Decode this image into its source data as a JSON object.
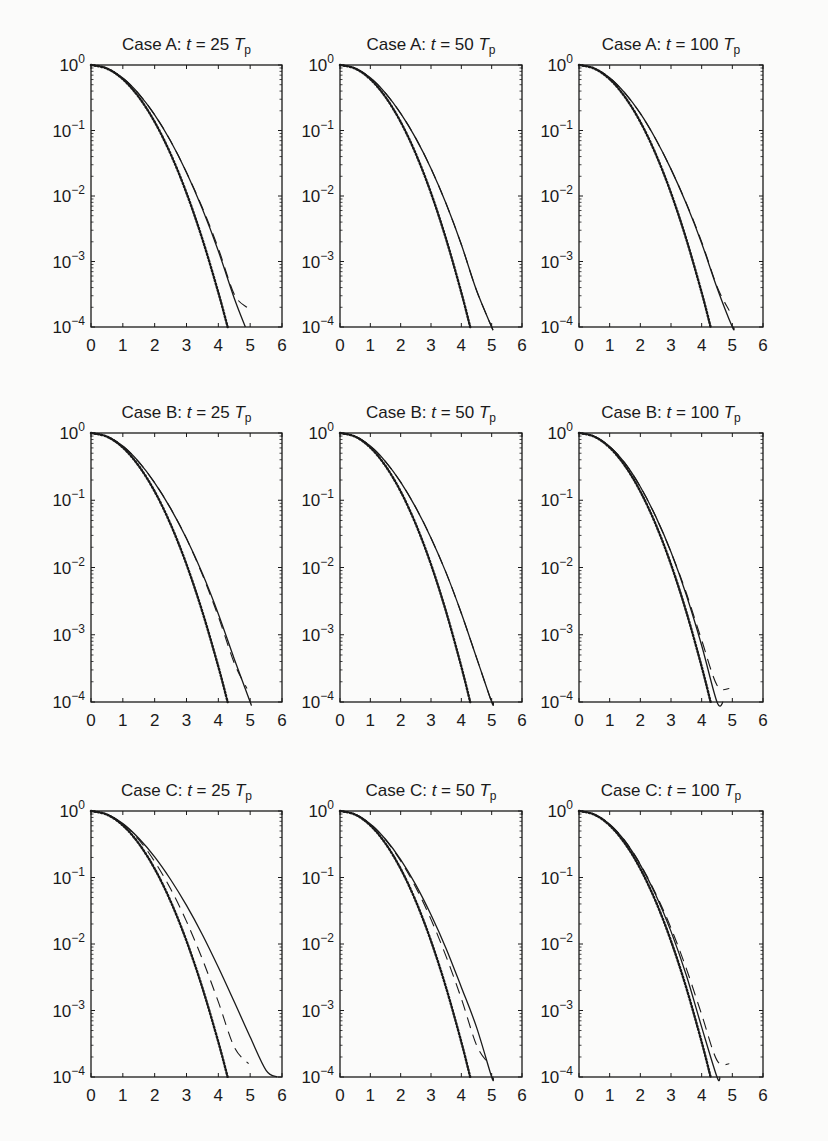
{
  "chart_data": {
    "type": "line",
    "layout": {
      "rows": 3,
      "cols": 3,
      "grid": false,
      "legend": "none"
    },
    "x_ticks": [
      "0",
      "1",
      "2",
      "3",
      "4",
      "5",
      "6"
    ],
    "xlim": [
      0,
      6
    ],
    "y_ticks": [
      "10^0",
      "10^-1",
      "10^-2",
      "10^-3",
      "10^-4"
    ],
    "ylim": [
      0.0001,
      1
    ],
    "yscale": "log",
    "series_styles": {
      "reference": "dotted with markers (Rayleigh)",
      "solid": "solid line",
      "dashed": "dashed line"
    },
    "x": [
      0,
      0.5,
      1,
      1.5,
      2,
      2.5,
      3,
      3.5,
      4,
      4.5,
      5,
      5.5,
      6
    ],
    "panels": [
      {
        "id": "A25",
        "case": "A",
        "t": "25",
        "title": "Case A: t = 25 T_p",
        "series": [
          {
            "name": "reference",
            "log10": [
              0,
              -0.054,
              -0.217,
              -0.489,
              -0.869,
              -1.357,
              -1.954,
              -2.66,
              -3.474,
              -4.0,
              null,
              null,
              null
            ]
          },
          {
            "name": "solid",
            "log10": [
              0,
              -0.05,
              -0.2,
              -0.44,
              -0.76,
              -1.16,
              -1.64,
              -2.2,
              -2.84,
              -3.56,
              null,
              null,
              null
            ],
            "end_x": 4.85
          },
          {
            "name": "dashed",
            "log10": [
              0,
              -0.05,
              -0.2,
              -0.44,
              -0.76,
              -1.16,
              -1.64,
              -2.18,
              -2.8,
              -3.5,
              null,
              null,
              null
            ],
            "end": [
              4.9,
              -3.7
            ]
          }
        ]
      },
      {
        "id": "A50",
        "case": "A",
        "t": "50",
        "title": "Case A: t = 50 T_p",
        "series": [
          {
            "name": "reference",
            "log10": [
              0,
              -0.054,
              -0.217,
              -0.489,
              -0.869,
              -1.357,
              -1.954,
              -2.66,
              -3.474,
              -4.0,
              null,
              null,
              null
            ]
          },
          {
            "name": "solid",
            "log10": [
              0,
              -0.05,
              -0.195,
              -0.43,
              -0.74,
              -1.12,
              -1.58,
              -2.12,
              -2.74,
              -3.44,
              -4.0,
              null,
              null
            ],
            "end_x": 5.0
          },
          {
            "name": "dashed",
            "log10": [
              0,
              -0.05,
              -0.195,
              -0.43,
              -0.74,
              -1.12,
              -1.58,
              -2.12,
              -2.74,
              -3.44,
              -4.0,
              null,
              null
            ],
            "end_x": 5.0
          }
        ]
      },
      {
        "id": "A100",
        "case": "A",
        "t": "100",
        "title": "Case A: t = 100 T_p",
        "series": [
          {
            "name": "reference",
            "log10": [
              0,
              -0.054,
              -0.217,
              -0.489,
              -0.869,
              -1.357,
              -1.954,
              -2.66,
              -3.474,
              -4.0,
              null,
              null,
              null
            ]
          },
          {
            "name": "solid",
            "log10": [
              0,
              -0.05,
              -0.195,
              -0.43,
              -0.74,
              -1.13,
              -1.59,
              -2.12,
              -2.72,
              -3.4,
              -4.0,
              null,
              null
            ],
            "end_x": 5.05
          },
          {
            "name": "dashed",
            "log10": [
              0,
              -0.05,
              -0.195,
              -0.43,
              -0.74,
              -1.13,
              -1.59,
              -2.11,
              -2.7,
              -3.38,
              null,
              null,
              null
            ],
            "end": [
              4.9,
              -3.75
            ]
          }
        ]
      },
      {
        "id": "B25",
        "case": "B",
        "t": "25",
        "title": "Case B: t = 25 T_p",
        "series": [
          {
            "name": "reference",
            "log10": [
              0,
              -0.054,
              -0.217,
              -0.489,
              -0.869,
              -1.357,
              -1.954,
              -2.66,
              -3.474,
              -4.0,
              null,
              null,
              null
            ]
          },
          {
            "name": "solid",
            "log10": [
              0,
              -0.05,
              -0.195,
              -0.43,
              -0.74,
              -1.12,
              -1.57,
              -2.09,
              -2.69,
              -3.36,
              -4.0,
              null,
              null
            ],
            "end_x": 5.0
          },
          {
            "name": "dashed",
            "log10": [
              0,
              -0.05,
              -0.195,
              -0.43,
              -0.74,
              -1.12,
              -1.57,
              -2.11,
              -2.73,
              -3.42,
              null,
              null,
              null
            ],
            "end": [
              4.9,
              -3.8
            ]
          }
        ]
      },
      {
        "id": "B50",
        "case": "B",
        "t": "50",
        "title": "Case B: t = 50 T_p",
        "series": [
          {
            "name": "reference",
            "log10": [
              0,
              -0.054,
              -0.217,
              -0.489,
              -0.869,
              -1.357,
              -1.954,
              -2.66,
              -3.474,
              -4.0,
              null,
              null,
              null
            ]
          },
          {
            "name": "solid",
            "log10": [
              0,
              -0.05,
              -0.195,
              -0.425,
              -0.73,
              -1.11,
              -1.56,
              -2.08,
              -2.68,
              -3.34,
              -4.0,
              null,
              null
            ],
            "end_x": 5.05
          },
          {
            "name": "dashed",
            "log10": [
              0,
              -0.05,
              -0.195,
              -0.425,
              -0.73,
              -1.11,
              -1.56,
              -2.08,
              -2.68,
              -3.34,
              -4.0,
              null,
              null
            ],
            "end_x": 5.05
          }
        ]
      },
      {
        "id": "B100",
        "case": "B",
        "t": "100",
        "title": "Case B: t = 100 T_p",
        "series": [
          {
            "name": "reference",
            "log10": [
              0,
              -0.054,
              -0.217,
              -0.489,
              -0.869,
              -1.357,
              -1.954,
              -2.66,
              -3.474,
              -4.0,
              null,
              null,
              null
            ]
          },
          {
            "name": "solid",
            "log10": [
              0,
              -0.05,
              -0.2,
              -0.45,
              -0.8,
              -1.24,
              -1.77,
              -2.41,
              -3.16,
              -4.0,
              null,
              null,
              null
            ],
            "end_x": 4.7
          },
          {
            "name": "dashed",
            "log10": [
              0,
              -0.05,
              -0.2,
              -0.45,
              -0.8,
              -1.24,
              -1.77,
              -2.38,
              -3.08,
              -3.75,
              null,
              null,
              null
            ],
            "end": [
              4.9,
              -3.8
            ]
          }
        ]
      },
      {
        "id": "C25",
        "case": "C",
        "t": "25",
        "title": "Case C: t = 25 T_p",
        "series": [
          {
            "name": "reference",
            "log10": [
              0,
              -0.054,
              -0.217,
              -0.489,
              -0.869,
              -1.357,
              -1.954,
              -2.66,
              -3.474,
              -4.0,
              null,
              null,
              null
            ]
          },
          {
            "name": "solid",
            "log10": [
              0,
              -0.05,
              -0.19,
              -0.41,
              -0.69,
              -1.03,
              -1.42,
              -1.86,
              -2.35,
              -2.87,
              -3.4,
              -3.9,
              null
            ],
            "end_x": 5.85
          },
          {
            "name": "dashed",
            "log10": [
              0,
              -0.05,
              -0.195,
              -0.43,
              -0.76,
              -1.17,
              -1.66,
              -2.23,
              -2.87,
              -3.55,
              null,
              null,
              null
            ],
            "end": [
              4.95,
              -3.8
            ]
          }
        ]
      },
      {
        "id": "C50",
        "case": "C",
        "t": "50",
        "title": "Case C: t = 50 T_p",
        "series": [
          {
            "name": "reference",
            "log10": [
              0,
              -0.054,
              -0.217,
              -0.489,
              -0.869,
              -1.357,
              -1.954,
              -2.66,
              -3.474,
              -4.0,
              null,
              null,
              null
            ]
          },
          {
            "name": "solid",
            "log10": [
              0,
              -0.05,
              -0.195,
              -0.425,
              -0.73,
              -1.11,
              -1.56,
              -2.07,
              -2.65,
              -3.25,
              -4.0,
              null,
              null
            ],
            "end_x": 5.05
          },
          {
            "name": "dashed",
            "log10": [
              0,
              -0.05,
              -0.195,
              -0.43,
              -0.75,
              -1.15,
              -1.63,
              -2.19,
              -2.82,
              -3.52,
              null,
              null,
              null
            ],
            "end": [
              4.9,
              -3.8
            ]
          }
        ]
      },
      {
        "id": "C100",
        "case": "C",
        "t": "100",
        "title": "Case C: t = 100 T_p",
        "series": [
          {
            "name": "reference",
            "log10": [
              0,
              -0.054,
              -0.217,
              -0.489,
              -0.869,
              -1.357,
              -1.954,
              -2.66,
              -3.474,
              -4.0,
              null,
              null,
              null
            ]
          },
          {
            "name": "solid",
            "log10": [
              0,
              -0.05,
              -0.2,
              -0.455,
              -0.81,
              -1.26,
              -1.81,
              -2.47,
              -3.25,
              -4.0,
              null,
              null,
              null
            ],
            "end_x": 4.6
          },
          {
            "name": "dashed",
            "log10": [
              0,
              -0.05,
              -0.2,
              -0.45,
              -0.8,
              -1.24,
              -1.76,
              -2.37,
              -3.06,
              -3.75,
              null,
              null,
              null
            ],
            "end": [
              4.9,
              -3.8
            ]
          }
        ]
      }
    ]
  },
  "labels": {
    "panel_titles": [
      {
        "prefix": "Case A: ",
        "var": "t",
        "eq": " = 25",
        "T": "T",
        "sub": "p"
      },
      {
        "prefix": "Case A: ",
        "var": "t",
        "eq": " = 50",
        "T": "T",
        "sub": "p"
      },
      {
        "prefix": "Case A: ",
        "var": "t",
        "eq": " = 100",
        "T": "T",
        "sub": "p"
      },
      {
        "prefix": "Case B: ",
        "var": "t",
        "eq": " = 25",
        "T": "T",
        "sub": "p"
      },
      {
        "prefix": "Case B: ",
        "var": "t",
        "eq": " = 50",
        "T": "T",
        "sub": "p"
      },
      {
        "prefix": "Case B: ",
        "var": "t",
        "eq": " = 100",
        "T": "T",
        "sub": "p"
      },
      {
        "prefix": "Case C: ",
        "var": "t",
        "eq": " = 25",
        "T": "T",
        "sub": "p"
      },
      {
        "prefix": "Case C: ",
        "var": "t",
        "eq": " = 50",
        "T": "T",
        "sub": "p"
      },
      {
        "prefix": "Case C: ",
        "var": "t",
        "eq": " = 100",
        "T": "T",
        "sub": "p"
      }
    ]
  },
  "colors": {
    "ink": "#1a1a1a",
    "paper": "#fbfbfa",
    "bleed": "#d8d8d6"
  }
}
